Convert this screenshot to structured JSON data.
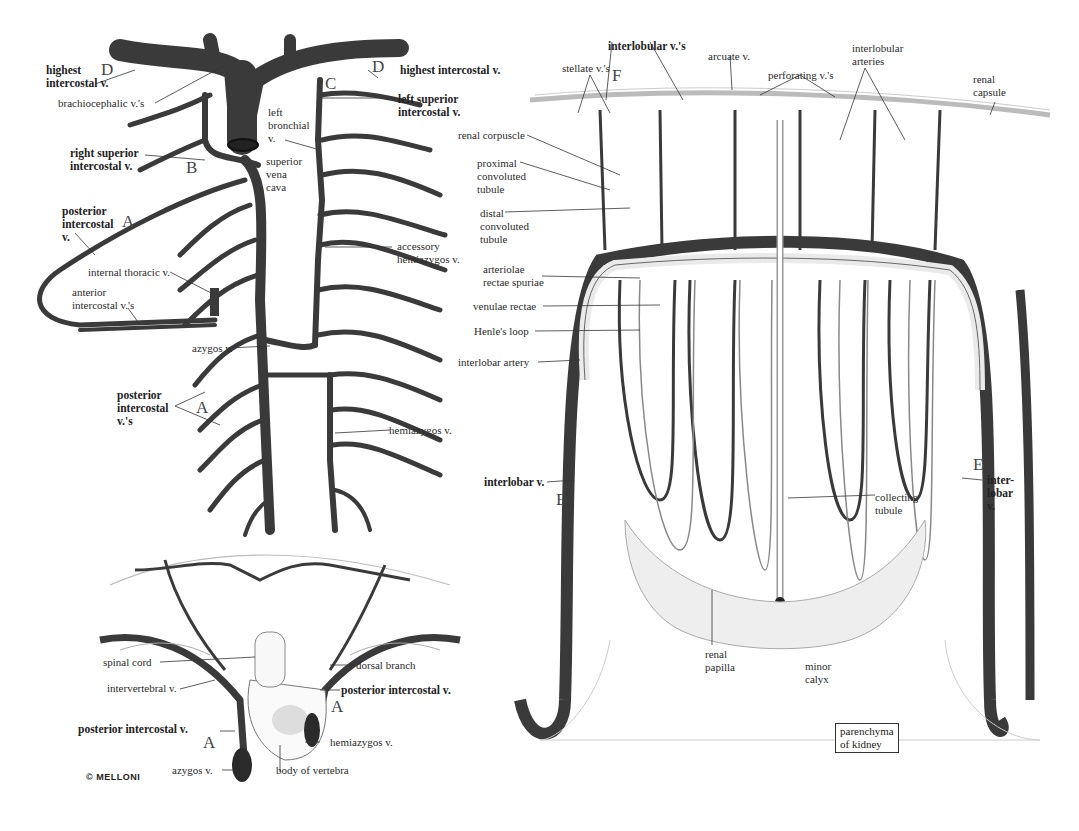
{
  "figure": {
    "credit": "© MELLONI",
    "panels": {
      "thoracic_veins": {
        "labels": {
          "highest_intercostal_left": "highest\nintercostal v.",
          "brachiocephalic": "brachiocephalic v.'s",
          "right_superior_intercostal": "right superior\nintercostal v.",
          "posterior_intercostal_v": "posterior\nintercostal\nv.",
          "internal_thoracic": "internal thoracic v.",
          "anterior_intercostal": "anterior\nintercostal v.'s",
          "azygos": "azygos v.",
          "posterior_intercostal_vs": "posterior\nintercostal\nv.'s",
          "highest_intercostal_right": "highest intercostal v.",
          "left_superior_intercostal": "left superior\nintercostal v.",
          "left_bronchial": "left\nbronchial\nv.",
          "superior_vena_cava": "superior\nvena\ncava",
          "accessory_hemiazygos": "accessory\nhemiazygos v.",
          "hemiazygos": "hemiazygos v."
        },
        "letters": {
          "A1": "A",
          "A2": "A",
          "B": "B",
          "C": "C",
          "D1": "D",
          "D2": "D"
        }
      },
      "vertebral_section": {
        "labels": {
          "spinal_cord": "spinal cord",
          "intervertebral": "intervertebral v.",
          "posterior_intercostal_left": "posterior intercostal v.",
          "azygos": "azygos v.",
          "body_of_vertebra": "body of vertebra",
          "hemiazygos": "hemiazygos v.",
          "posterior_intercostal_right": "posterior intercostal v.",
          "dorsal_branch": "dorsal branch"
        },
        "letters": {
          "A1": "A",
          "A2": "A"
        }
      },
      "kidney": {
        "labels": {
          "interlobular_vs": "interlobular v.'s",
          "stellate": "stellate v.'s",
          "arcuate": "arcuate v.",
          "perforating": "perforating v.'s",
          "interlobular_arteries": "interlobular\narteries",
          "renal_capsule": "renal\ncapsule",
          "renal_corpuscle": "renal corpuscle",
          "proximal": "proximal\nconvoluted\ntubule",
          "distal": "distal\nconvoluted\ntubule",
          "arteriolae": "arteriolae\nrectae spuriae",
          "venulae": "venulae rectae",
          "henle": "Henle's loop",
          "interlobar_artery": "interlobar artery",
          "interlobar_v_left": "interlobar v.",
          "interlobar_v_right": "inter-\nlobar\nv.",
          "collecting_tubule": "collecting\ntubule",
          "renal_papilla": "renal\npapilla",
          "minor_calyx": "minor\ncalyx",
          "parenchyma": "parenchyma\nof kidney"
        },
        "letters": {
          "E1": "E",
          "E2": "E",
          "F": "F"
        }
      }
    },
    "colors": {
      "vein": "#3a3a3a",
      "artery": "#f2f2f2",
      "outline": "#555555",
      "line": "#333333"
    }
  }
}
